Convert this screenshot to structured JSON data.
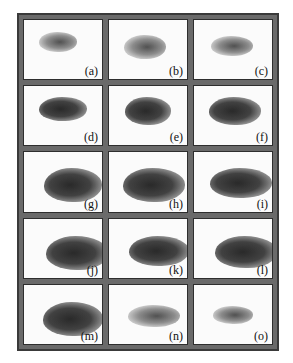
{
  "figure": {
    "rows": 5,
    "columns": 3,
    "panels": [
      {
        "label": "(a)",
        "blob": {
          "left": 30,
          "top": 30,
          "width": 38,
          "height": 20,
          "tone": "light"
        }
      },
      {
        "label": "(b)",
        "blob": {
          "left": 30,
          "top": 38,
          "width": 42,
          "height": 24,
          "tone": "light"
        }
      },
      {
        "label": "(c)",
        "blob": {
          "left": 34,
          "top": 40,
          "width": 42,
          "height": 20,
          "tone": "light"
        }
      },
      {
        "label": "(d)",
        "blob": {
          "left": 30,
          "top": 28,
          "width": 48,
          "height": 24,
          "tone": "dark"
        }
      },
      {
        "label": "(e)",
        "blob": {
          "left": 32,
          "top": 28,
          "width": 46,
          "height": 28,
          "tone": "dark"
        }
      },
      {
        "label": "(f)",
        "blob": {
          "left": 30,
          "top": 28,
          "width": 52,
          "height": 28,
          "tone": "dark"
        }
      },
      {
        "label": "(g)",
        "blob": {
          "left": 40,
          "top": 38,
          "width": 58,
          "height": 34,
          "tone": "dark"
        }
      },
      {
        "label": "(h)",
        "blob": {
          "left": 28,
          "top": 38,
          "width": 62,
          "height": 34,
          "tone": "dark"
        }
      },
      {
        "label": "(i)",
        "blob": {
          "left": 32,
          "top": 40,
          "width": 62,
          "height": 30,
          "tone": "dark"
        }
      },
      {
        "label": "(j)",
        "blob": {
          "left": 43,
          "top": 44,
          "width": 62,
          "height": 34,
          "tone": "dark"
        }
      },
      {
        "label": "(k)",
        "blob": {
          "left": 40,
          "top": 44,
          "width": 60,
          "height": 30,
          "tone": "dark"
        }
      },
      {
        "label": "(l)",
        "blob": {
          "left": 42,
          "top": 44,
          "width": 62,
          "height": 32,
          "tone": "dark"
        }
      },
      {
        "label": "(m)",
        "blob": {
          "left": 38,
          "top": 44,
          "width": 60,
          "height": 34,
          "tone": "dark"
        }
      },
      {
        "label": "(n)",
        "blob": {
          "left": 38,
          "top": 50,
          "width": 52,
          "height": 22,
          "tone": "light"
        }
      },
      {
        "label": "(o)",
        "blob": {
          "left": 38,
          "top": 54,
          "width": 40,
          "height": 18,
          "tone": "light"
        }
      }
    ]
  }
}
